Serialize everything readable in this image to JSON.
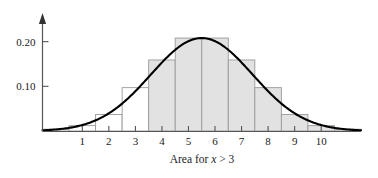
{
  "chart_data": {
    "type": "bar",
    "title": "",
    "subtitle": "",
    "caption_prefix": "Area for ",
    "caption_variable": "x",
    "caption_suffix": " > 3",
    "caption_full": "Area for x > 3",
    "xlabel": "",
    "ylabel": "",
    "xlim": [
      -0.5,
      11.5
    ],
    "ylim": [
      0,
      0.235
    ],
    "grid": false,
    "legend": null,
    "y_ticks": [
      0.1,
      0.2
    ],
    "y_tick_labels": [
      "0.10",
      "0.20"
    ],
    "x_ticks": [
      1,
      2,
      3,
      4,
      5,
      6,
      7,
      8,
      9,
      10
    ],
    "x_tick_labels": [
      "1",
      "2",
      "3",
      "4",
      "5",
      "6",
      "7",
      "8",
      "9",
      "10"
    ],
    "bin_width": 1,
    "shade_threshold": 3,
    "categories": [
      "0",
      "1",
      "2",
      "3",
      "4",
      "5",
      "6",
      "7",
      "8",
      "9",
      "10",
      "11"
    ],
    "bars": [
      {
        "center": 0,
        "left": -0.5,
        "right": 0.5,
        "height": 0.004,
        "shaded": false
      },
      {
        "center": 1,
        "left": 0.5,
        "right": 1.5,
        "height": 0.012,
        "shaded": false
      },
      {
        "center": 2,
        "left": 1.5,
        "right": 2.5,
        "height": 0.037,
        "shaded": false
      },
      {
        "center": 3,
        "left": 2.5,
        "right": 3.5,
        "height": 0.097,
        "shaded": false
      },
      {
        "center": 4,
        "left": 3.5,
        "right": 4.5,
        "height": 0.159,
        "shaded": true
      },
      {
        "center": 5,
        "left": 4.5,
        "right": 5.5,
        "height": 0.208,
        "shaded": true
      },
      {
        "center": 6,
        "left": 5.5,
        "right": 6.5,
        "height": 0.208,
        "shaded": true
      },
      {
        "center": 7,
        "left": 6.5,
        "right": 7.5,
        "height": 0.159,
        "shaded": true
      },
      {
        "center": 8,
        "left": 7.5,
        "right": 8.5,
        "height": 0.097,
        "shaded": true
      },
      {
        "center": 9,
        "left": 8.5,
        "right": 9.5,
        "height": 0.037,
        "shaded": true
      },
      {
        "center": 10,
        "left": 9.5,
        "right": 10.5,
        "height": 0.012,
        "shaded": true
      },
      {
        "center": 11,
        "left": 10.5,
        "right": 11.5,
        "height": 0.004,
        "shaded": true
      }
    ],
    "curve": {
      "name": "normal-density",
      "mean": 5.5,
      "std_dev": 1.92,
      "peak": 0.208,
      "color": "#000000"
    },
    "colors": {
      "bar_fill_shaded": "#e2e2e2",
      "bar_fill_unshaded": "#ffffff",
      "bar_stroke": "#9a9a9a",
      "axis": "#555555",
      "curve": "#000000",
      "text": "#1a1a1a",
      "background": "#ffffff"
    }
  }
}
